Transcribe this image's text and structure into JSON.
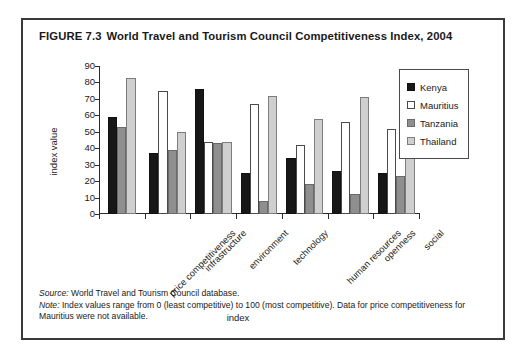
{
  "figure": {
    "number": "FIGURE 7.3",
    "title": "World Travel and Tourism Council Competitiveness Index, 2004"
  },
  "notes": {
    "source_lead": "Source:",
    "source_text": " World Travel and Tourism Council database.",
    "note_lead": "Note:",
    "note_text": " Index values range from 0 (least competitive) to 100 (most competitive). Data for price competitiveness for Mauritius were not available."
  },
  "legend": {
    "position": "right",
    "entries": [
      {
        "label": "Kenya",
        "color": "#171717",
        "key": "kenya"
      },
      {
        "label": "Mauritius",
        "color": "#ffffff",
        "key": "mauritius"
      },
      {
        "label": "Tanzania",
        "color": "#8f8f8f",
        "key": "tanzania"
      },
      {
        "label": "Thailand",
        "color": "#cfcfcf",
        "key": "thailand"
      }
    ]
  },
  "chart_data": {
    "type": "bar",
    "title": "World Travel and Tourism Council Competitiveness Index, 2004",
    "xlabel": "index",
    "ylabel": "index value",
    "ylim": [
      0,
      90
    ],
    "yticks": [
      0,
      10,
      20,
      30,
      40,
      50,
      60,
      70,
      80,
      90
    ],
    "grid": false,
    "legend_position": "right",
    "categories": [
      "price competitiveness",
      "infrastructure",
      "environment",
      "technology",
      "human resources",
      "openness",
      "social"
    ],
    "series": [
      {
        "name": "Kenya",
        "values": [
          59,
          37,
          76,
          25,
          34,
          26,
          25
        ]
      },
      {
        "name": "Mauritius",
        "values": [
          null,
          75,
          44,
          67,
          42,
          56,
          52
        ]
      },
      {
        "name": "Tanzania",
        "values": [
          53,
          39,
          43,
          8,
          18,
          12,
          23
        ]
      },
      {
        "name": "Thailand",
        "values": [
          83,
          50,
          44,
          72,
          58,
          71,
          47
        ]
      }
    ]
  }
}
